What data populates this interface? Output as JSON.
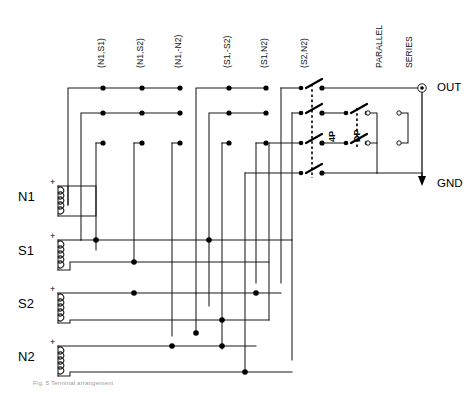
{
  "figure": {
    "kind": "schematic",
    "caption": "Fig. 5 Terminal arrangement"
  },
  "column_labels": [
    {
      "text": "(N1,S1)",
      "x": 96,
      "y": 68
    },
    {
      "text": "(N1,S2)",
      "x": 135,
      "y": 68
    },
    {
      "text": "(N1,-N2)",
      "x": 173,
      "y": 68
    },
    {
      "text": "(S1,-S2)",
      "x": 222,
      "y": 68
    },
    {
      "text": "(S1,N2)",
      "x": 259,
      "y": 68
    },
    {
      "text": "(S2,N2)",
      "x": 299,
      "y": 68
    }
  ],
  "switch_labels": [
    {
      "text": "PARALLEL",
      "x": 374,
      "y": 68
    },
    {
      "text": "SERIES",
      "x": 404,
      "y": 68
    }
  ],
  "switch_poles": [
    {
      "text": "4P",
      "x": 327,
      "y": 142
    },
    {
      "text": "DP",
      "x": 352,
      "y": 142
    }
  ],
  "windings": [
    {
      "name": "N1",
      "label_x": 18,
      "label_y": 189,
      "coil_x": 58,
      "coil_top": 186,
      "coil_bottom": 216,
      "polarity": "+"
    },
    {
      "name": "S1",
      "label_x": 18,
      "label_y": 243,
      "coil_x": 58,
      "coil_top": 240,
      "coil_bottom": 270,
      "polarity": "+"
    },
    {
      "name": "S2",
      "label_x": 18,
      "label_y": 296,
      "coil_x": 58,
      "coil_top": 293,
      "coil_bottom": 323,
      "polarity": "+"
    },
    {
      "name": "N2",
      "label_x": 18,
      "label_y": 349,
      "coil_x": 58,
      "coil_top": 346,
      "coil_bottom": 376,
      "polarity": "+"
    }
  ],
  "terminals": [
    {
      "name": "OUT",
      "x": 428,
      "y": 78,
      "type": "circle-terminal"
    },
    {
      "name": "GND",
      "x": 428,
      "y": 183,
      "type": "ground-arrow"
    }
  ],
  "colors": {
    "wire": "#1a1a1a",
    "node": "#000000",
    "dashed_gang": "#000000",
    "background": "#ffffff",
    "caption": "#9a9a9a"
  },
  "geometry": {
    "bus_rows_y": [
      88,
      113,
      143,
      173
    ],
    "column_x": [
      103,
      142,
      180,
      229,
      266,
      306
    ],
    "switch_4p_x": 306,
    "switch_dp_x": 351,
    "parallel_bus_x": 377,
    "series_bus_x": 404,
    "out_rail_x": 422
  }
}
